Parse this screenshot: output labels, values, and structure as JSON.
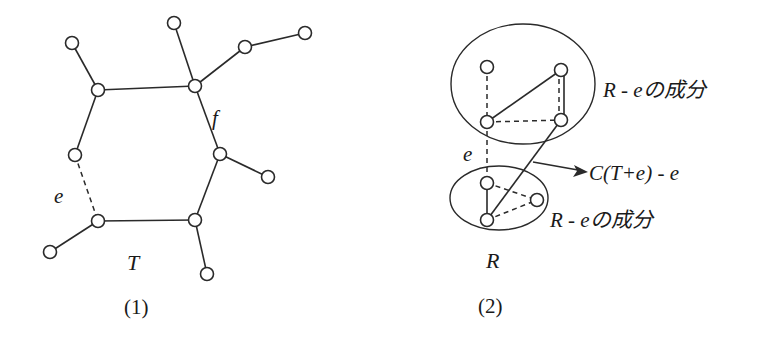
{
  "diagram": {
    "left": {
      "caption": "(1)",
      "tree_label": "T",
      "edge_e_label": "e",
      "edge_f_label": "f",
      "nodes": [
        {
          "id": "leaf_tl",
          "x": 72,
          "y": 43
        },
        {
          "id": "hex_tl",
          "x": 98,
          "y": 90
        },
        {
          "id": "leaf_top",
          "x": 174,
          "y": 23
        },
        {
          "id": "hex_tr",
          "x": 195,
          "y": 86
        },
        {
          "id": "leaf_r1",
          "x": 245,
          "y": 47
        },
        {
          "id": "leaf_r2",
          "x": 305,
          "y": 33
        },
        {
          "id": "hex_ml",
          "x": 75,
          "y": 155
        },
        {
          "id": "hex_mr",
          "x": 220,
          "y": 154
        },
        {
          "id": "leaf_r3",
          "x": 268,
          "y": 177
        },
        {
          "id": "hex_bl",
          "x": 98,
          "y": 221
        },
        {
          "id": "hex_br",
          "x": 195,
          "y": 220
        },
        {
          "id": "leaf_bl",
          "x": 50,
          "y": 252
        },
        {
          "id": "leaf_b",
          "x": 207,
          "y": 274
        }
      ],
      "edges": [
        {
          "from": "leaf_tl",
          "to": "hex_tl",
          "style": "solid"
        },
        {
          "from": "hex_tl",
          "to": "hex_tr",
          "style": "solid"
        },
        {
          "from": "leaf_top",
          "to": "hex_tr",
          "style": "solid"
        },
        {
          "from": "hex_tr",
          "to": "leaf_r1",
          "style": "solid"
        },
        {
          "from": "leaf_r1",
          "to": "leaf_r2",
          "style": "solid"
        },
        {
          "from": "hex_tl",
          "to": "hex_ml",
          "style": "solid"
        },
        {
          "from": "hex_tr",
          "to": "hex_mr",
          "style": "solid",
          "label": "f"
        },
        {
          "from": "hex_mr",
          "to": "leaf_r3",
          "style": "solid"
        },
        {
          "from": "hex_ml",
          "to": "hex_bl",
          "style": "dashed",
          "label": "e"
        },
        {
          "from": "hex_mr",
          "to": "hex_br",
          "style": "solid"
        },
        {
          "from": "hex_bl",
          "to": "hex_br",
          "style": "solid"
        },
        {
          "from": "hex_bl",
          "to": "leaf_bl",
          "style": "solid"
        },
        {
          "from": "hex_br",
          "to": "leaf_b",
          "style": "solid"
        }
      ]
    },
    "right": {
      "caption": "(2)",
      "graph_label": "R",
      "edge_e_label": "e",
      "component_top_label": "R - eの成分",
      "component_bottom_label": "R - eの成分",
      "cycle_label": "C(T+e) - e",
      "nodes": [
        {
          "id": "A",
          "x": 487,
          "y": 67
        },
        {
          "id": "B",
          "x": 561,
          "y": 70
        },
        {
          "id": "C",
          "x": 487,
          "y": 122
        },
        {
          "id": "D",
          "x": 561,
          "y": 120
        },
        {
          "id": "E",
          "x": 487,
          "y": 183
        },
        {
          "id": "F",
          "x": 537,
          "y": 200
        },
        {
          "id": "G",
          "x": 487,
          "y": 220
        }
      ],
      "edges": [
        {
          "from": "A",
          "to": "C",
          "style": "dashed"
        },
        {
          "from": "C",
          "to": "B",
          "style": "solid"
        },
        {
          "from": "B",
          "to": "D",
          "style": "solid+dashed"
        },
        {
          "from": "C",
          "to": "D",
          "style": "dashed"
        },
        {
          "from": "C",
          "to": "E",
          "style": "dashed",
          "label": "e"
        },
        {
          "from": "D",
          "to": "G",
          "style": "solid"
        },
        {
          "from": "E",
          "to": "G",
          "style": "solid"
        },
        {
          "from": "E",
          "to": "F",
          "style": "dashed"
        },
        {
          "from": "G",
          "to": "F",
          "style": "dashed"
        }
      ]
    }
  }
}
